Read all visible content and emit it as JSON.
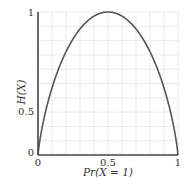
{
  "chart_data": {
    "type": "line",
    "title": "",
    "xlabel": "Pr(X = 1)",
    "ylabel": "H(X)",
    "xlim": [
      0,
      1
    ],
    "ylim": [
      0,
      1
    ],
    "grid": true,
    "x_ticks": [
      "0",
      "0.5",
      "1"
    ],
    "y_ticks": [
      "0",
      "0.5",
      "1"
    ],
    "series": [
      {
        "name": "binary entropy",
        "x": [
          0,
          0.01,
          0.05,
          0.1,
          0.2,
          0.3,
          0.4,
          0.5,
          0.6,
          0.7,
          0.8,
          0.9,
          0.95,
          0.99,
          1
        ],
        "values": [
          0,
          0.081,
          0.286,
          0.469,
          0.722,
          0.881,
          0.971,
          1.0,
          0.971,
          0.881,
          0.722,
          0.469,
          0.286,
          0.081,
          0
        ]
      }
    ]
  },
  "colors": {
    "axis": "#444444",
    "curve": "#555555",
    "grid": "#e6e6e6",
    "text": "#333333"
  }
}
